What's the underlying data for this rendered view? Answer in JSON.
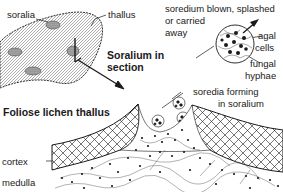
{
  "diagram": {
    "title": "Foliose lichen thallus",
    "inset_title_line1": "Soralium in",
    "inset_title_line2": "section",
    "labels": {
      "soralia": "soralia",
      "thallus": "thallus",
      "soredium_line1": "soredium blown, splashed",
      "soredium_line2": "or carried",
      "soredium_line3": "away",
      "agal_line1": "agal",
      "agal_line2": "cells",
      "fungal_line1": "fungal",
      "fungal_line2": "hyphae",
      "soredia_forming_line1": "soredia forming",
      "soredia_forming_line2": "in soralium",
      "cortex": "cortex",
      "medulla": "medulla"
    },
    "colors": {
      "ink": "#1a1a1a",
      "background": "#ffffff",
      "stipple": "#9a9a9a"
    }
  }
}
